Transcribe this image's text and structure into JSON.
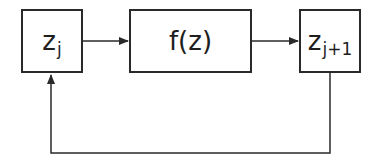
{
  "diagram": {
    "type": "feedback-loop block diagram",
    "nodes": [
      {
        "id": "zj",
        "base": "z",
        "subscript": "j"
      },
      {
        "id": "f",
        "label": "f(z)"
      },
      {
        "id": "zj1",
        "base": "z",
        "subscript": "j+1"
      }
    ],
    "edges": [
      {
        "from": "zj",
        "to": "f",
        "arrow": true
      },
      {
        "from": "f",
        "to": "zj1",
        "arrow": true
      },
      {
        "from": "zj1",
        "to": "zj",
        "arrow": true,
        "route": "feedback below"
      }
    ],
    "colors": {
      "line": "#2a2a2a",
      "background": "#ffffff"
    }
  }
}
